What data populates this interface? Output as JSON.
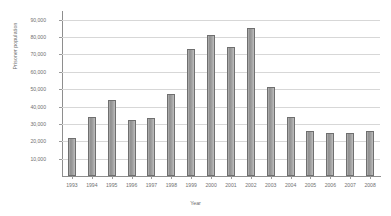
{
  "chart_data": {
    "type": "bar",
    "title": "",
    "xlabel": "Year",
    "ylabel": "Prisoner population",
    "categories": [
      "1993",
      "1994",
      "1995",
      "1996",
      "1997",
      "1998",
      "1999",
      "2000",
      "2001",
      "2002",
      "2003",
      "2004",
      "2005",
      "2006",
      "2007",
      "2008"
    ],
    "values": [
      22000,
      34000,
      44000,
      32000,
      33500,
      47000,
      73000,
      81000,
      74000,
      85000,
      51000,
      34000,
      26000,
      25000,
      24500,
      26000
    ],
    "ytick_labels": [
      "90,000",
      "80,000",
      "70,000",
      "60,000",
      "50,000",
      "40,000",
      "30,000",
      "20,000",
      "10,000"
    ],
    "ytick_values": [
      90000,
      80000,
      70000,
      60000,
      50000,
      40000,
      30000,
      20000,
      10000
    ],
    "ylim": [
      0,
      95000
    ],
    "grid": true,
    "legend": "none",
    "series": [
      {
        "name": "Prisoner population",
        "values": [
          22000,
          34000,
          44000,
          32000,
          33500,
          47000,
          73000,
          81000,
          74000,
          85000,
          51000,
          34000,
          26000,
          25000,
          24500,
          26000
        ]
      }
    ],
    "bar_color": "#9a9a9a",
    "grid_color": "#d7d7d7",
    "axis_color": "#8e8e8e"
  }
}
